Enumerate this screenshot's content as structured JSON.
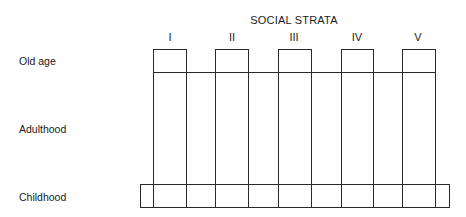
{
  "diagram": {
    "title": "SOCIAL STRATA",
    "strata": [
      {
        "label": "I",
        "x_left": 153,
        "x_right": 186
      },
      {
        "label": "II",
        "x_left": 215,
        "x_right": 248
      },
      {
        "label": "III",
        "x_left": 278,
        "x_right": 311
      },
      {
        "label": "IV",
        "x_left": 341,
        "x_right": 373
      },
      {
        "label": "V",
        "x_left": 402,
        "x_right": 435
      }
    ],
    "life_stages": [
      {
        "label": "Old age",
        "y": 61
      },
      {
        "label": "Adulthood",
        "y": 129
      },
      {
        "label": "Childhood",
        "y": 197
      }
    ],
    "line_color": "#2a2a2a"
  }
}
